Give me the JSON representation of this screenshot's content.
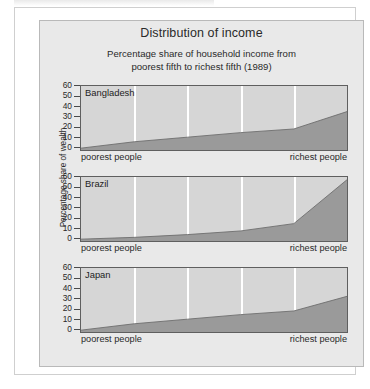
{
  "figure": {
    "title": "Distribution of income",
    "subtitle_line1": "Percentage share of household income from",
    "subtitle_line2": "poorest fifth to richest fifth (1989)",
    "y_axis_label": "Percentage share of wealth",
    "x_label_left": "poorest people",
    "x_label_right": "richest people"
  },
  "colors": {
    "page_background": "#ffffff",
    "figure_background": "#e9e9e9",
    "plot_background": "#d6d6d6",
    "area_fill": "#9a9a9a",
    "area_line": "#6e6e6e",
    "gridline": "#ffffff",
    "axis": "#5f5f5f",
    "text": "#2a2a2a"
  },
  "y_ticks": [
    "60",
    "50",
    "40",
    "30",
    "20",
    "10",
    "0"
  ],
  "chart_data": {
    "type": "area",
    "title": "Distribution of income",
    "subtitle": "Percentage share of household income from poorest fifth to richest fifth (1989)",
    "xlabel": "",
    "ylabel": "Percentage share of wealth",
    "ylim": [
      0,
      70
    ],
    "yticks": [
      0,
      10,
      20,
      30,
      40,
      50,
      60
    ],
    "grid": true,
    "gridline_count": 4,
    "x_tick_labels": [
      "poorest people",
      "richest people"
    ],
    "x": [
      0,
      1,
      2,
      3,
      4,
      5
    ],
    "x_categories": [
      "poorest fifth",
      "2nd fifth",
      "3rd fifth",
      "4th fifth",
      "richest fifth"
    ],
    "panels": [
      {
        "name": "Bangladesh",
        "values": [
          2,
          9,
          14,
          19,
          23,
          42
        ]
      },
      {
        "name": "Brazil",
        "values": [
          2,
          4,
          7,
          11,
          19,
          67
        ]
      },
      {
        "name": "Japan",
        "values": [
          2,
          9,
          14,
          19,
          23,
          39
        ]
      }
    ]
  }
}
